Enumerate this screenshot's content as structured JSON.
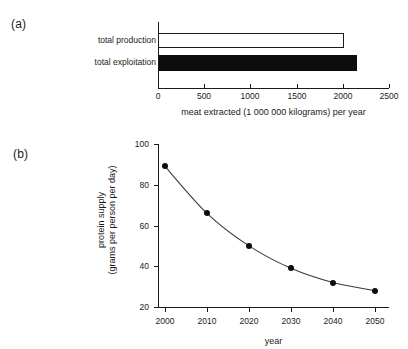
{
  "figure": {
    "panel_a_label": "(a)",
    "panel_b_label": "(b)"
  },
  "chart_data": [
    {
      "type": "bar",
      "orientation": "horizontal",
      "panel": "(a)",
      "title": "",
      "categories": [
        "total production",
        "total exploitation"
      ],
      "values": [
        2010,
        2150
      ],
      "bar_styles": [
        "open",
        "filled"
      ],
      "xlabel": "meat extracted (1 000 000 kilograms) per year",
      "ylabel": "",
      "xlim": [
        0,
        2500
      ],
      "xticks": [
        0,
        500,
        1000,
        1500,
        2000,
        2500
      ],
      "xtick_labels": [
        "0",
        "500",
        "1000",
        "1500",
        "2000",
        "2500"
      ],
      "grid": false,
      "legend": "none"
    },
    {
      "type": "line",
      "panel": "(b)",
      "title": "",
      "x": [
        2000,
        2010,
        2020,
        2030,
        2040,
        2050
      ],
      "values": [
        89,
        66,
        50,
        39,
        32,
        28
      ],
      "series": [
        {
          "name": "protein supply",
          "values": [
            89,
            66,
            50,
            39,
            32,
            28
          ]
        }
      ],
      "xlabel": "year",
      "ylabel": "protein supply (grams per person per day)",
      "ylabel_line1": "protein supply",
      "ylabel_line2": "(grams per person per day)",
      "xlim": [
        2000,
        2050
      ],
      "ylim": [
        20,
        100
      ],
      "xticks": [
        2000,
        2010,
        2020,
        2030,
        2040,
        2050
      ],
      "xtick_labels": [
        "2000",
        "2010",
        "2020",
        "2030",
        "2040",
        "2050"
      ],
      "yticks": [
        20,
        40,
        60,
        80,
        100
      ],
      "ytick_labels": [
        "20",
        "40",
        "60",
        "80",
        "100"
      ],
      "marker": "filled-circle",
      "grid": false,
      "legend": "none"
    }
  ],
  "colors": {
    "ink": "#1a1a1a",
    "bar_fill": "#0d0d0d",
    "bar_open": "#ffffff",
    "line": "#3c3c3c",
    "background": "#ffffff"
  }
}
